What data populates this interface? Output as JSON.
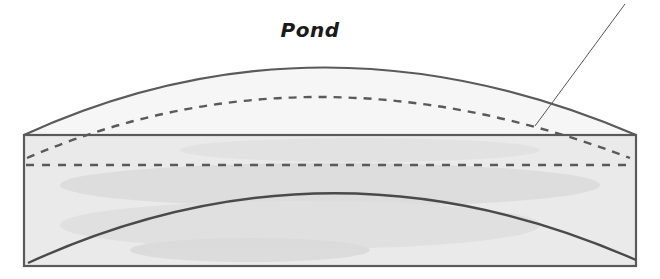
{
  "diagram": {
    "title": "Pond",
    "colors": {
      "outline": "#5a5a5a",
      "fill": "#e8e8e8",
      "fill_shade": "#d6d6d6",
      "leader": "#555555",
      "text": "#1a1a1a"
    },
    "elements": [
      {
        "name": "pond-body-rectangle",
        "type": "rectangle",
        "style": "solid"
      },
      {
        "name": "pond-top-surface-arc",
        "type": "arc",
        "style": "solid"
      },
      {
        "name": "water-level-arc",
        "type": "arc",
        "style": "dashed"
      },
      {
        "name": "water-level-line",
        "type": "line",
        "style": "dashed"
      },
      {
        "name": "pond-bottom-arc",
        "type": "arc",
        "style": "solid"
      },
      {
        "name": "leader-line",
        "type": "line",
        "style": "solid",
        "label": ""
      }
    ]
  }
}
